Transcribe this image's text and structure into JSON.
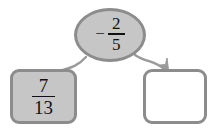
{
  "diagram": {
    "type": "fraction-operation-flow",
    "background_color": "#ffffff",
    "operator_node": {
      "shape": "ellipse",
      "sign": "−",
      "fraction": {
        "numerator": "2",
        "denominator": "5"
      },
      "value_text": "− 2/5",
      "fill_color": "#c6c6c6",
      "border_color": "#8c8c8c"
    },
    "left_box": {
      "shape": "rounded-rectangle",
      "fraction": {
        "numerator": "7",
        "denominator": "13"
      },
      "value_text": "7/13",
      "fill_color": "#c6c6c6",
      "border_color": "#8c8c8c"
    },
    "right_box": {
      "shape": "rounded-rectangle",
      "value_text": "",
      "fill_color": "#ffffff",
      "border_color": "#8c8c8c",
      "state": "empty"
    },
    "arrows": [
      {
        "name": "arrow-to-left-box",
        "from": "operator-ellipse",
        "to": "left-box",
        "has_arrowhead": false,
        "color": "#9a9a9a"
      },
      {
        "name": "arrow-to-right-box",
        "from": "operator-ellipse",
        "to": "right-box",
        "has_arrowhead": true,
        "color": "#9a9a9a"
      }
    ]
  }
}
